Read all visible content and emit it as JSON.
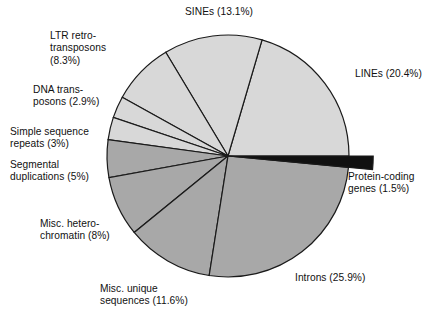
{
  "figure": {
    "background_color": "#ffffff",
    "center": {
      "x": 228,
      "y": 156
    },
    "radius": 121
  },
  "colors": {
    "light_gray": "#d8d8d8",
    "mid_gray": "#a8a8a8",
    "black": "#111111",
    "outline": "#1a1a1a",
    "text": "#111111"
  },
  "chart_data": {
    "type": "pie",
    "title": "",
    "subtitle": "",
    "xlabel": "",
    "ylabel": "",
    "grid": false,
    "legend_position": "none",
    "labels_inline": true,
    "start_angle_deg": 0,
    "direction": "counterclockwise",
    "units": "percent",
    "total": 99.7,
    "categories": [
      "LINEs",
      "SINEs",
      "LTR retrotransposons",
      "DNA transposons",
      "Simple sequence repeats",
      "Segmental duplications",
      "Misc. heterochromatin",
      "Misc. unique sequences",
      "Introns",
      "Protein-coding genes"
    ],
    "values": [
      20.4,
      13.1,
      8.3,
      2.9,
      3.0,
      5.0,
      8.0,
      11.6,
      25.9,
      1.5
    ],
    "slices": [
      {
        "name": "LINEs",
        "value": 20.4,
        "color": "#d8d8d8",
        "exploded": false
      },
      {
        "name": "SINEs",
        "value": 13.1,
        "color": "#d8d8d8",
        "exploded": false
      },
      {
        "name": "LTR retrotransposons",
        "value": 8.3,
        "color": "#d8d8d8",
        "exploded": false
      },
      {
        "name": "DNA transposons",
        "value": 2.9,
        "color": "#d8d8d8",
        "exploded": false
      },
      {
        "name": "Simple sequence repeats",
        "value": 3.0,
        "color": "#d8d8d8",
        "exploded": false
      },
      {
        "name": "Segmental duplications",
        "value": 5.0,
        "color": "#a8a8a8",
        "exploded": false
      },
      {
        "name": "Misc. heterochromatin",
        "value": 8.0,
        "color": "#a8a8a8",
        "exploded": false
      },
      {
        "name": "Misc. unique sequences",
        "value": 11.6,
        "color": "#a8a8a8",
        "exploded": false
      },
      {
        "name": "Introns",
        "value": 25.9,
        "color": "#a8a8a8",
        "exploded": false
      },
      {
        "name": "Protein-coding genes",
        "value": 1.5,
        "color": "#111111",
        "exploded": true
      }
    ]
  },
  "labels": {
    "sines": "SINEs (13.1%)",
    "ltr": "LTR retro-\ntransposons\n(8.3%)",
    "dna": "DNA trans-\nposons (2.9%)",
    "ssr": "Simple sequence\nrepeats (3%)",
    "segdup": "Segmental\nduplications (5%)",
    "hetero": "Misc. hetero-\nchromatin (8%)",
    "miscuniq": "Misc. unique\nsequences (11.6%)",
    "introns": "Introns (25.9%)",
    "protein": "Protein-coding\ngenes (1.5%)",
    "lines": "LINEs (20.4%)"
  }
}
